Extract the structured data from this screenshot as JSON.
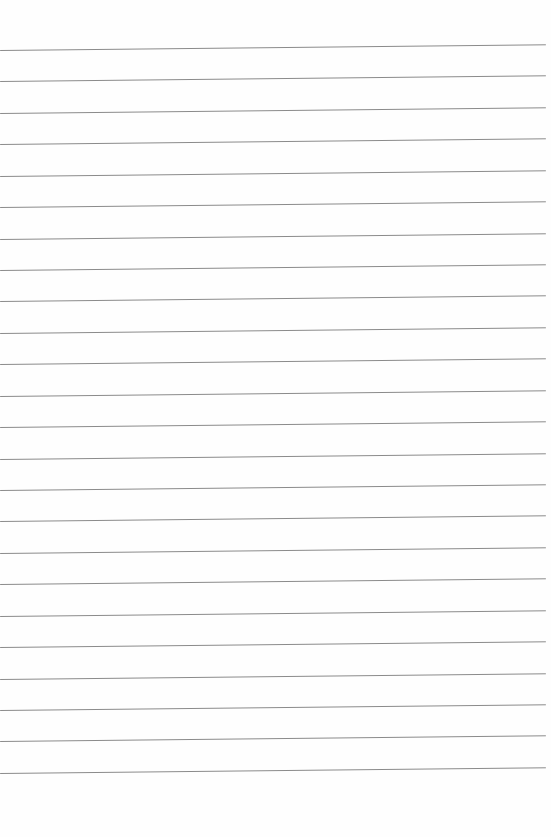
{
  "page": {
    "background_color": "#fefefe",
    "ruled_lines": {
      "count": 24,
      "first_line_top": 50,
      "line_spacing": 31.43,
      "line_left": 0,
      "line_width": 546,
      "line_thickness": 1.3,
      "line_color": "#8a8a8a",
      "tilt_deg": -0.6
    }
  }
}
